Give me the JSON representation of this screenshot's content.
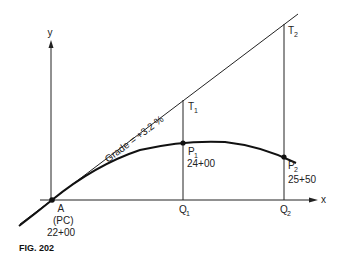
{
  "figure": {
    "caption": "FIG. 202",
    "axes": {
      "x_label": "x",
      "y_label": "y"
    },
    "tangent": {
      "label": "Grade = +3.2 %"
    },
    "points": {
      "A": {
        "name": "A",
        "sub": "(PC)",
        "station": "22+00"
      },
      "T1": {
        "name": "T",
        "sub": "1"
      },
      "T2": {
        "name": "T",
        "sub": "2"
      },
      "P1": {
        "name": "P",
        "sub": "1",
        "station": "24+00"
      },
      "P2": {
        "name": "P",
        "sub": "2",
        "station": "25+50"
      },
      "Q1": {
        "name": "Q",
        "sub": "1"
      },
      "Q2": {
        "name": "Q",
        "sub": "2"
      }
    },
    "colors": {
      "line": "#222222",
      "background": "#ffffff"
    }
  }
}
